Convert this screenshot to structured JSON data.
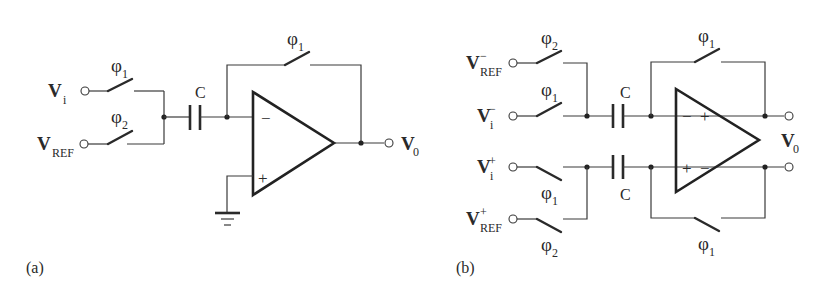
{
  "figure": {
    "panels": [
      {
        "id": "a",
        "caption": "(a)",
        "inputs": [
          {
            "name": "V",
            "subscript": "i",
            "superscript": "",
            "switch_phase": "φ",
            "switch_phase_sub": "1"
          },
          {
            "name": "V",
            "subscript": "REF",
            "superscript": "",
            "switch_phase": "φ",
            "switch_phase_sub": "2"
          }
        ],
        "capacitor_label": "C",
        "feedback_switch": {
          "phase": "φ",
          "phase_sub": "1"
        },
        "opamp": {
          "inverting_sign": "−",
          "noninverting_sign": "+"
        },
        "output": {
          "name": "V",
          "subscript": "0"
        },
        "noninverting_input": "ground"
      },
      {
        "id": "b",
        "caption": "(b)",
        "inputs": [
          {
            "name": "V",
            "subscript": "REF",
            "superscript": "−",
            "switch_phase": "φ",
            "switch_phase_sub": "2"
          },
          {
            "name": "V",
            "subscript": "i",
            "superscript": "−",
            "switch_phase": "φ",
            "switch_phase_sub": "1"
          },
          {
            "name": "V",
            "subscript": "i",
            "superscript": "+",
            "switch_phase": "φ",
            "switch_phase_sub": "1"
          },
          {
            "name": "V",
            "subscript": "REF",
            "superscript": "+",
            "switch_phase": "φ",
            "switch_phase_sub": "2"
          }
        ],
        "capacitor_labels": [
          "C",
          "C"
        ],
        "feedback_switches": [
          {
            "phase": "φ",
            "phase_sub": "1"
          },
          {
            "phase": "φ",
            "phase_sub": "1"
          }
        ],
        "opamp": {
          "top_in_sign": "−",
          "top_out_sign": "+",
          "bottom_in_sign": "+",
          "bottom_out_sign": "−"
        },
        "output": {
          "name": "V",
          "subscript": "0"
        }
      }
    ]
  }
}
